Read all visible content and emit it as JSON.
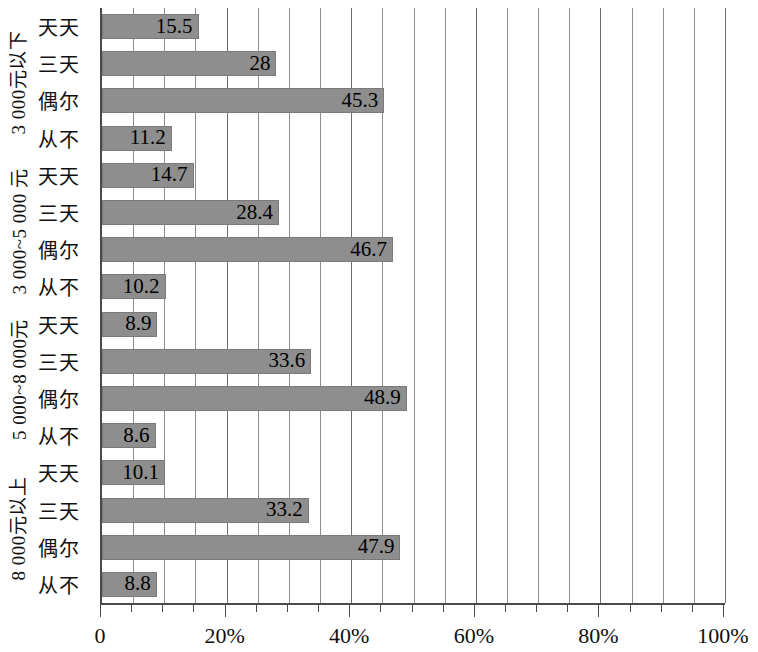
{
  "chart_data": {
    "type": "bar",
    "orientation": "horizontal",
    "title": "",
    "xlabel": "",
    "ylabel": "",
    "xlim": [
      0,
      100
    ],
    "xticks": [
      0,
      20,
      40,
      60,
      80,
      100
    ],
    "xtick_labels": [
      "0",
      "20%",
      "40%",
      "60%",
      "80%",
      "100%"
    ],
    "grid": true,
    "gridline_interval": 5,
    "legend": null,
    "bar_color": "#8e8e8e",
    "axis_color": "#4a4a4a",
    "groups": [
      {
        "label": "3 000元以下",
        "categories": [
          "天天",
          "三天",
          "偶尔",
          "从不"
        ],
        "values": [
          15.5,
          28,
          45.3,
          11.2
        ],
        "value_labels": [
          "15.5",
          "28",
          "45.3",
          "11.2"
        ]
      },
      {
        "label": "3 000~5 000 元",
        "categories": [
          "天天",
          "三天",
          "偶尔",
          "从不"
        ],
        "values": [
          14.7,
          28.4,
          46.7,
          10.2
        ],
        "value_labels": [
          "14.7",
          "28.4",
          "46.7",
          "10.2"
        ]
      },
      {
        "label": "5 000~8 000元",
        "categories": [
          "天天",
          "三天",
          "偶尔",
          "从不"
        ],
        "values": [
          8.9,
          33.6,
          48.9,
          8.6
        ],
        "value_labels": [
          "8.9",
          "33.6",
          "48.9",
          "8.6"
        ]
      },
      {
        "label": "8 000元以上",
        "categories": [
          "天天",
          "三天",
          "偶尔",
          "从不"
        ],
        "values": [
          10.1,
          33.2,
          47.9,
          8.8
        ],
        "value_labels": [
          "10.1",
          "33.2",
          "47.9",
          "8.8"
        ]
      }
    ]
  }
}
